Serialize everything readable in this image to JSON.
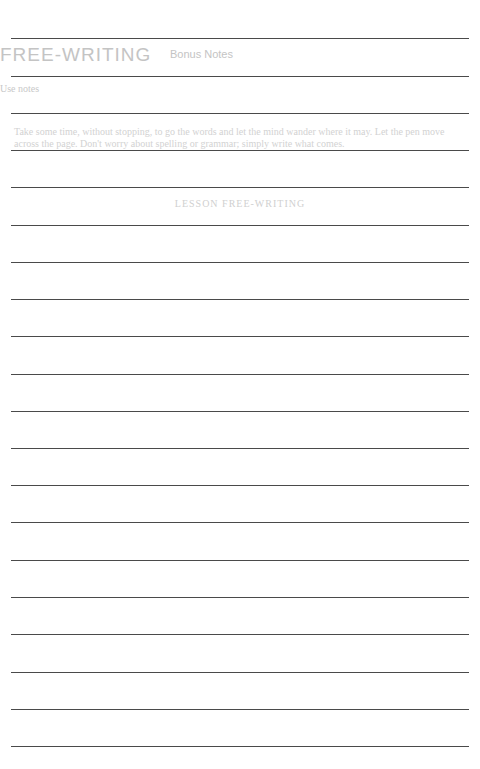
{
  "header": {
    "title": "FREE-WRITING",
    "subtitle": "Bonus Notes",
    "label": "Use notes"
  },
  "instructions": {
    "text": "Take some time, without stopping, to go the words and let the mind wander where it may. Let the pen move across the page. Don't worry about spelling or grammar; simply write what comes."
  },
  "section_heading": "LESSON FREE-WRITING",
  "lines": {
    "color": "#4a4a4a",
    "count": 20,
    "y_positions": [
      38,
      76,
      113,
      150,
      187,
      225,
      262,
      299,
      336,
      374,
      411,
      448,
      485,
      522,
      560,
      597,
      634,
      672,
      709,
      746
    ]
  }
}
